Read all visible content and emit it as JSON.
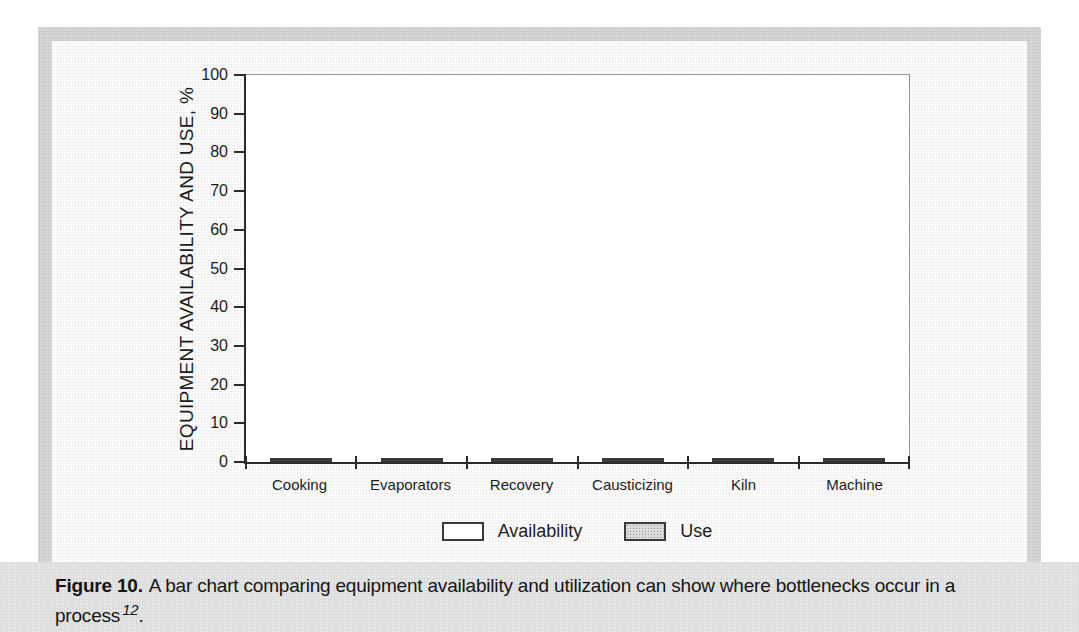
{
  "chart_data": {
    "type": "bar",
    "title": "",
    "ylabel": "EQUIPMENT AVAILABILITY AND USE, %",
    "xlabel": "",
    "ylim": [
      0,
      100
    ],
    "yticks": [
      0,
      10,
      20,
      30,
      40,
      50,
      60,
      70,
      80,
      90,
      100
    ],
    "grid": false,
    "legend_position": "bottom-center",
    "categories": [
      "Cooking",
      "Evaporators",
      "Recovery",
      "Causticizing",
      "Kiln",
      "Machine"
    ],
    "series": [
      {
        "name": "Availability",
        "fill": "#ffffff",
        "pattern": "none",
        "values": [
          93,
          84,
          94,
          92.5,
          96,
          92.5
        ]
      },
      {
        "name": "Use",
        "fill": "#dcdcdc",
        "pattern": "stipple",
        "values": [
          81.5,
          82,
          79.5,
          81,
          78.5,
          78.5
        ]
      }
    ]
  },
  "caption": {
    "label": "Figure 10.",
    "text": "A bar chart comparing equipment availability and utilization can show where bottlenecks occur in a process",
    "reference_superscript": "12",
    "terminator": "."
  },
  "colors": {
    "panel_border": "#d8d8d8",
    "caption_background": "#e6e6e6",
    "axis": "#2b2b2b",
    "bar_outline": "#3a3a3a",
    "availability_bar_fill": "#ffffff",
    "use_bar_fill": "#dcdcdc",
    "text": "#1c1c1c"
  }
}
